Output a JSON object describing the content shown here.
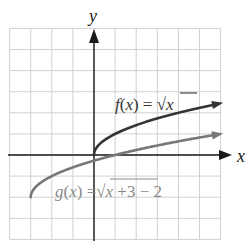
{
  "chart_data": {
    "type": "line",
    "title": "",
    "xlabel": "x",
    "ylabel": "y",
    "xlim": [
      -4,
      6
    ],
    "ylim": [
      -4,
      6
    ],
    "grid": true,
    "grid_step": 1,
    "series": [
      {
        "name": "f(x) = √x",
        "label_text": "f(x) = √x",
        "color": "#333333",
        "domain": [
          0,
          6
        ],
        "points": [
          [
            0,
            0
          ],
          [
            0.25,
            0.5
          ],
          [
            1,
            1
          ],
          [
            2,
            1.41
          ],
          [
            3,
            1.73
          ],
          [
            4,
            2
          ],
          [
            5,
            2.24
          ],
          [
            6,
            2.45
          ]
        ]
      },
      {
        "name": "g(x) = √(x+3) − 2",
        "label_text": "g(x) = √x+3 − 2",
        "color": "#777777",
        "domain": [
          -3,
          6
        ],
        "points": [
          [
            -3,
            -2
          ],
          [
            -2.75,
            -1.5
          ],
          [
            -2,
            -1
          ],
          [
            -1,
            -0.59
          ],
          [
            0,
            -0.27
          ],
          [
            1,
            0
          ],
          [
            2,
            0.24
          ],
          [
            3,
            0.45
          ],
          [
            4,
            0.65
          ],
          [
            5,
            0.83
          ],
          [
            6,
            1
          ]
        ]
      }
    ]
  },
  "labels": {
    "x_axis": "x",
    "y_axis": "y",
    "f_label": "f(x) = √x",
    "g_label": "g(x) = √x+3 − 2"
  },
  "colors": {
    "grid": "#d0d0d0",
    "axis": "#1a1a1a",
    "f_curve": "#333333",
    "g_curve": "#777777",
    "g_text": "#8a8a8a"
  }
}
